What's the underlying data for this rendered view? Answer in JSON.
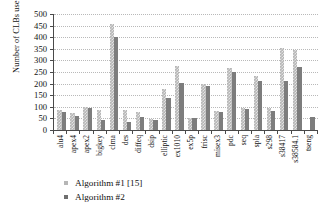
{
  "chart_data": {
    "type": "bar",
    "title": "",
    "xlabel": "",
    "ylabel": "Number of CLBs used",
    "ylim": [
      0,
      500
    ],
    "ytick_step": 50,
    "yticks": [
      500,
      450,
      400,
      350,
      300,
      250,
      200,
      150,
      100,
      50,
      0
    ],
    "grid": true,
    "legend_position": "below-left",
    "categories": [
      "alu4",
      "apex4",
      "apex2",
      "bigkey",
      "clma",
      "des",
      "diffeq",
      "dsip",
      "elliptic",
      "ex1010",
      "ex5p",
      "frisc",
      "misex3",
      "pdc",
      "seq",
      "spla",
      "s298",
      "s38417",
      "s38584.1",
      "tseng"
    ],
    "series": [
      {
        "name": "Algorithm #1 [15]",
        "color": "#b6b6b6",
        "values": [
          85,
          72,
          101,
          85,
          455,
          88,
          76,
          48,
          176,
          276,
          51,
          199,
          80,
          266,
          95,
          233,
          97,
          353,
          347,
          0
        ]
      },
      {
        "name": "Algorithm #2",
        "color": "#7d7d7d",
        "values": [
          77,
          62,
          95,
          42,
          402,
          36,
          55,
          45,
          136,
          204,
          53,
          188,
          78,
          251,
          89,
          211,
          84,
          213,
          271,
          56
        ]
      }
    ]
  },
  "legend": {
    "items": [
      {
        "label": "Algorithm #1 [15]"
      },
      {
        "label": "Algorithm #2"
      }
    ]
  }
}
